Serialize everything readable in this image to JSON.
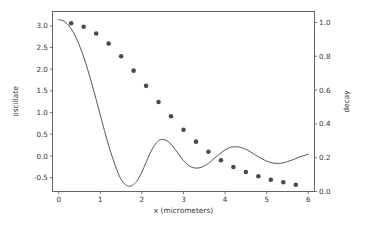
{
  "figure": {
    "background_color": "#ffffff",
    "frame_color": "#555555",
    "width": 371,
    "height": 226
  },
  "chart_data": {
    "type": "line",
    "title": "",
    "subtitle": "",
    "xlabel": "x (micrometers)",
    "ylabel": "oscillate",
    "y2label": "decay",
    "xlim": [
      -0.15,
      6.15
    ],
    "ylim": [
      -0.82,
      3.33
    ],
    "y2lim": [
      0.0,
      1.065
    ],
    "grid": false,
    "legend": null,
    "legend_position": "none",
    "xticks": [
      0,
      1,
      2,
      3,
      4,
      5,
      6
    ],
    "xticklabels": [
      "0",
      "1",
      "2",
      "3",
      "4",
      "5",
      "6"
    ],
    "yticks": [
      -0.5,
      0.0,
      0.5,
      1.0,
      1.5,
      2.0,
      2.5,
      3.0
    ],
    "yticklabels": [
      "-0.5",
      "0.0",
      "0.5",
      "1.0",
      "1.5",
      "2.0",
      "2.5",
      "3.0"
    ],
    "y2ticks": [
      0.0,
      0.2,
      0.4,
      0.6,
      0.8,
      1.0
    ],
    "y2ticklabels": [
      "0.0",
      "0.2",
      "0.4",
      "0.6",
      "0.8",
      "1.0"
    ],
    "series": [
      {
        "name": "oscillate",
        "type": "line",
        "axis": "left",
        "color": "#4d4d4d",
        "linewidth": 0.95,
        "marker": "none",
        "x": [
          0.0,
          0.1,
          0.2,
          0.3,
          0.4,
          0.5,
          0.6,
          0.7,
          0.8,
          0.9,
          1.0,
          1.1,
          1.2,
          1.3,
          1.4,
          1.5,
          1.6,
          1.7,
          1.8,
          1.9,
          2.0,
          2.1,
          2.2,
          2.3,
          2.4,
          2.5,
          2.6,
          2.7,
          2.8,
          2.9,
          3.0,
          3.1,
          3.2,
          3.3,
          3.4,
          3.5,
          3.6,
          3.7,
          3.8,
          3.9,
          4.0,
          4.1,
          4.2,
          4.3,
          4.4,
          4.5,
          4.6,
          4.7,
          4.8,
          4.9,
          5.0,
          5.1,
          5.2,
          5.3,
          5.4,
          5.5,
          5.6,
          5.7,
          5.8,
          5.9,
          6.0
        ],
        "y": [
          3.14,
          3.12,
          3.05,
          2.93,
          2.76,
          2.54,
          2.28,
          1.98,
          1.65,
          1.3,
          0.94,
          0.58,
          0.24,
          -0.06,
          -0.33,
          -0.54,
          -0.66,
          -0.7,
          -0.66,
          -0.55,
          -0.37,
          -0.15,
          0.07,
          0.24,
          0.35,
          0.38,
          0.35,
          0.27,
          0.15,
          0.02,
          -0.11,
          -0.2,
          -0.26,
          -0.28,
          -0.27,
          -0.23,
          -0.17,
          -0.09,
          -0.01,
          0.07,
          0.14,
          0.19,
          0.21,
          0.21,
          0.19,
          0.15,
          0.1,
          0.04,
          -0.02,
          -0.07,
          -0.12,
          -0.15,
          -0.17,
          -0.17,
          -0.16,
          -0.13,
          -0.1,
          -0.06,
          -0.02,
          0.01,
          0.04
        ]
      },
      {
        "name": "decay",
        "type": "scatter",
        "axis": "right",
        "color": "#4a4a4a",
        "marker": "circle",
        "markersize": 3.3,
        "x": [
          0.3,
          0.6,
          0.9,
          1.2,
          1.5,
          1.8,
          2.1,
          2.4,
          2.7,
          3.0,
          3.3,
          3.6,
          3.9,
          4.2,
          4.5,
          4.8,
          5.1,
          5.4,
          5.7
        ],
        "y": [
          0.995,
          0.975,
          0.935,
          0.875,
          0.8,
          0.715,
          0.625,
          0.53,
          0.445,
          0.365,
          0.295,
          0.235,
          0.185,
          0.145,
          0.115,
          0.09,
          0.07,
          0.055,
          0.04
        ]
      }
    ]
  }
}
